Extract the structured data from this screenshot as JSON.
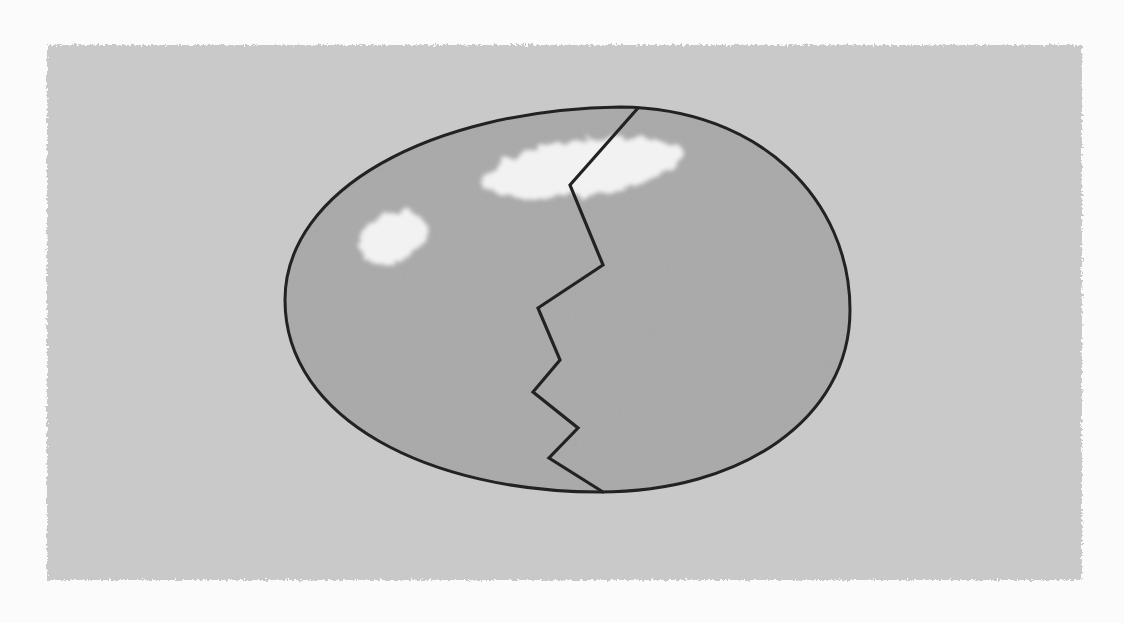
{
  "scene": {
    "subject": "cracked egg",
    "colors": {
      "page_background": "#fbfbfb",
      "panel_background": "#c9c9c9",
      "egg_fill": "#a9a9a9",
      "outline": "#222222",
      "highlight": "#f2f2f2"
    },
    "panel": {
      "x": 47,
      "y": 45,
      "width": 1035,
      "height": 535
    },
    "egg": {
      "path": "M 285 300 C 285 190, 430 110, 620 107 C 760 108, 850 200, 850 310 C 850 420, 740 492, 600 492 C 430 492, 285 420, 285 300 Z"
    },
    "crack": {
      "points": "638,108 570,185 603,265 538,308 560,360 533,392 578,428 549,458 603,492"
    },
    "highlights": [
      {
        "name": "large-highlight",
        "cx": 582,
        "cy": 168,
        "rx": 100,
        "ry": 28,
        "rotate": -8
      },
      {
        "name": "small-highlight",
        "cx": 393,
        "cy": 238,
        "rx": 36,
        "ry": 24,
        "rotate": -20
      }
    ]
  }
}
